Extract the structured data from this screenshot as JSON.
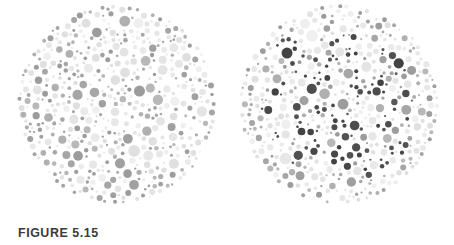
{
  "figure": {
    "caption": "FIGURE 5.15",
    "caption_color": "#3b3b3b",
    "background_color": "#ffffff",
    "width": 454,
    "height": 245,
    "type": "pseudoisochromatic-color-vision-test-plates",
    "plate_count": 2
  },
  "plates": [
    {
      "id": "left-plate",
      "name": "control-plate",
      "center_x": 117,
      "center_y": 104,
      "radius": 100,
      "has_hidden_figure": false,
      "dot_count": 520,
      "palette": {
        "light": [
          "#e4e4e4",
          "#eaeaea",
          "#efefef",
          "#e0e0e0",
          "#e7e7e7"
        ],
        "medium": [
          "#9c9c9c",
          "#a6a6a6",
          "#b0b0b0",
          "#b8b8b8",
          "#a0a0a0"
        ],
        "dark": []
      },
      "dot_size_min": 2,
      "dot_size_max": 12
    },
    {
      "id": "right-plate",
      "name": "hidden-figure-plate",
      "center_x": 339,
      "center_y": 104,
      "radius": 100,
      "has_hidden_figure": true,
      "dot_count": 520,
      "palette": {
        "light": [
          "#e4e4e4",
          "#eaeaea",
          "#efefef",
          "#e0e0e0",
          "#e7e7e7"
        ],
        "medium": [
          "#9c9c9c",
          "#a6a6a6",
          "#b0b0b0",
          "#b8b8b8",
          "#a0a0a0"
        ],
        "dark": [
          "#434343",
          "#4d4d4d",
          "#585858",
          "#484848",
          "#525252"
        ]
      },
      "dot_size_min": 2,
      "dot_size_max": 12
    }
  ]
}
